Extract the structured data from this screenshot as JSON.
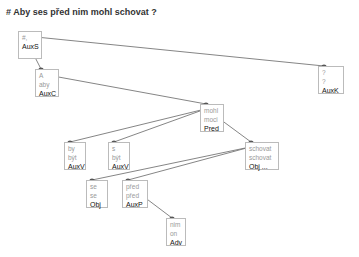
{
  "title": "# Aby ses před nim mohl schovat ?",
  "nodes": [
    {
      "id": "root",
      "form": "#,",
      "lemma": "",
      "afun": "AuxS",
      "x": 18,
      "y": 31,
      "w": 24,
      "h": 28
    },
    {
      "id": "aby",
      "form": "A",
      "lemma": "aby",
      "afun": "AuxC",
      "x": 35,
      "y": 69,
      "w": 24,
      "h": 28
    },
    {
      "id": "q",
      "form": "?",
      "lemma": "?",
      "afun": "AuxK",
      "x": 318,
      "y": 66,
      "w": 26,
      "h": 28
    },
    {
      "id": "mohl",
      "form": "mohl",
      "lemma": "moci",
      "afun": "Pred",
      "x": 200,
      "y": 104,
      "w": 24,
      "h": 28
    },
    {
      "id": "by",
      "form": "by",
      "lemma": "být",
      "afun": "AuxV",
      "x": 64,
      "y": 142,
      "w": 22,
      "h": 28
    },
    {
      "id": "s",
      "form": "s",
      "lemma": "být",
      "afun": "AuxV",
      "x": 108,
      "y": 142,
      "w": 22,
      "h": 28
    },
    {
      "id": "schovat",
      "form": "schovat",
      "lemma": "schovat",
      "afun": "Obj ...",
      "x": 245,
      "y": 142,
      "w": 34,
      "h": 28
    },
    {
      "id": "se",
      "form": "se",
      "lemma": "se",
      "afun": "Obj",
      "x": 86,
      "y": 180,
      "w": 22,
      "h": 28
    },
    {
      "id": "pred",
      "form": "před",
      "lemma": "před",
      "afun": "AuxP",
      "x": 122,
      "y": 180,
      "w": 26,
      "h": 28
    },
    {
      "id": "nim",
      "form": "nim",
      "lemma": "on",
      "afun": "Adv",
      "x": 166,
      "y": 218,
      "w": 20,
      "h": 28
    }
  ],
  "edges": [
    [
      "root",
      "aby"
    ],
    [
      "root",
      "q"
    ],
    [
      "aby",
      "mohl"
    ],
    [
      "mohl",
      "by"
    ],
    [
      "mohl",
      "s"
    ],
    [
      "mohl",
      "schovat"
    ],
    [
      "schovat",
      "se"
    ],
    [
      "schovat",
      "pred"
    ],
    [
      "pred",
      "nim"
    ]
  ],
  "colors": {
    "edge": "#777777",
    "edge_highlight": "#a05050",
    "border": "#bbbbbb"
  }
}
